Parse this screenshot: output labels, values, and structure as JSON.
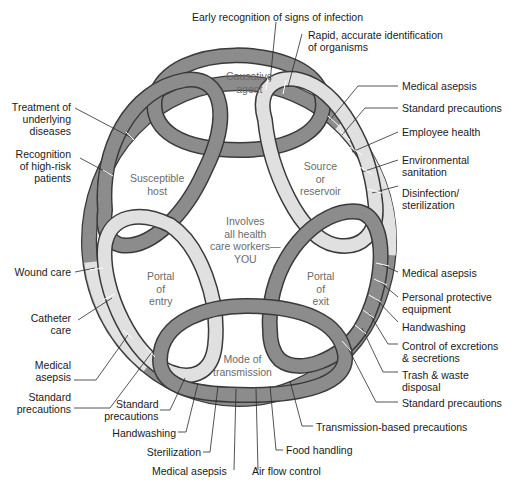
{
  "diagram": {
    "center_text": [
      "Involves",
      "all health",
      "care workers—",
      "YOU"
    ],
    "links": [
      {
        "id": "causative-agent",
        "lines": [
          "Causative",
          "agent"
        ],
        "color": "#8c8c8c"
      },
      {
        "id": "source-or-reservoir",
        "lines": [
          "Source",
          "or",
          "reservoir"
        ],
        "color": "#e0e0e0"
      },
      {
        "id": "portal-of-exit",
        "lines": [
          "Portal",
          "of",
          "exit"
        ],
        "color": "#8c8c8c"
      },
      {
        "id": "mode-of-transmission",
        "lines": [
          "Mode of",
          "transmission"
        ],
        "color": "#8c8c8c"
      },
      {
        "id": "portal-of-entry",
        "lines": [
          "Portal",
          "of",
          "entry"
        ],
        "color": "#e0e0e0"
      },
      {
        "id": "susceptible-host",
        "lines": [
          "Susceptible",
          "host"
        ],
        "color": "#8c8c8c"
      }
    ],
    "colors": {
      "dark_band": "#8c8c8c",
      "light_band": "#e0e0e0",
      "outline": "#3a3a3a",
      "text": "#1a1a1a",
      "inner_text": "#6b6b6b"
    },
    "labels": {
      "top": [
        {
          "text": "Early recognition of signs of infection"
        },
        {
          "lines": [
            "Rapid, accurate identification",
            "of organisms"
          ]
        }
      ],
      "right": [
        {
          "text": "Medical asepsis"
        },
        {
          "text": "Standard precautions"
        },
        {
          "text": "Employee health"
        },
        {
          "lines": [
            "Environmental",
            "sanitation"
          ]
        },
        {
          "lines": [
            "Disinfection/",
            "sterilization"
          ]
        },
        {
          "text": "Medical asepsis"
        },
        {
          "lines": [
            "Personal protective",
            "equipment"
          ]
        },
        {
          "text": "Handwashing"
        },
        {
          "lines": [
            "Control of excretions",
            "& secretions"
          ]
        },
        {
          "lines": [
            "Trash & waste",
            "disposal"
          ]
        },
        {
          "text": "Standard precautions"
        }
      ],
      "bottom": [
        {
          "text": "Transmission-based precautions"
        },
        {
          "text": "Food handling"
        },
        {
          "text": "Air flow control"
        },
        {
          "text": "Medical asepsis"
        },
        {
          "text": "Sterilization"
        },
        {
          "text": "Handwashing"
        },
        {
          "lines": [
            "Standard",
            "precautions"
          ]
        }
      ],
      "left": [
        {
          "lines": [
            "Treatment of",
            "underlying",
            "diseases"
          ]
        },
        {
          "lines": [
            "Recognition",
            "of high-risk",
            "patients"
          ]
        },
        {
          "text": "Wound care"
        },
        {
          "lines": [
            "Catheter",
            "care"
          ]
        },
        {
          "lines": [
            "Medical",
            "asepsis"
          ]
        },
        {
          "lines": [
            "Standard",
            "precautions"
          ]
        }
      ]
    }
  }
}
